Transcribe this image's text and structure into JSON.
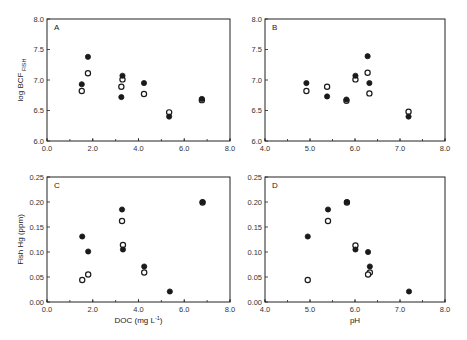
{
  "figure": {
    "header_note": "clipped running header (illegible)"
  },
  "chart_data": [
    {
      "panel": "A",
      "type": "scatter",
      "title": "",
      "xlabel": "",
      "ylabel": "log BCF",
      "ylabel_sub": "FISH",
      "xlim": [
        0.0,
        8.0
      ],
      "ylim": [
        6.0,
        8.0
      ],
      "x_ticks": [
        "0.0",
        "2.0",
        "4.0",
        "6.0",
        "8.0"
      ],
      "y_ticks": [
        "6.0",
        "6.5",
        "7.0",
        "7.5",
        "8.0"
      ],
      "x_minor_step": 1.0,
      "grid": false,
      "series": [
        {
          "name": "filled",
          "marker": "filled-circle",
          "x": [
            1.52,
            1.79,
            3.3,
            3.25,
            4.24,
            5.34,
            6.77
          ],
          "y": [
            6.93,
            7.38,
            7.07,
            6.72,
            6.95,
            6.4,
            6.69
          ]
        },
        {
          "name": "open",
          "marker": "open-circle",
          "x": [
            1.52,
            1.79,
            3.3,
            3.25,
            4.24,
            5.34,
            6.77
          ],
          "y": [
            6.82,
            7.11,
            7.01,
            6.89,
            6.77,
            6.47,
            6.67
          ]
        }
      ]
    },
    {
      "panel": "B",
      "type": "scatter",
      "title": "",
      "xlabel": "",
      "ylabel": "",
      "xlim": [
        4.0,
        8.0
      ],
      "ylim": [
        6.0,
        8.0
      ],
      "x_ticks": [
        "4.0",
        "5.0",
        "6.0",
        "7.0",
        "8.0"
      ],
      "y_ticks": [
        "6.0",
        "6.5",
        "7.0",
        "7.5",
        "8.0"
      ],
      "x_minor_step": 0.5,
      "grid": false,
      "series": [
        {
          "name": "filled",
          "marker": "filled-circle",
          "x": [
            4.92,
            5.38,
            5.81,
            6.01,
            6.28,
            6.32,
            7.19
          ],
          "y": [
            6.95,
            6.73,
            6.68,
            7.07,
            7.39,
            6.95,
            6.4
          ]
        },
        {
          "name": "open",
          "marker": "open-circle",
          "x": [
            4.92,
            5.38,
            5.81,
            6.01,
            6.28,
            6.32,
            7.19
          ],
          "y": [
            6.82,
            6.89,
            6.66,
            7.01,
            7.12,
            6.78,
            6.48
          ]
        }
      ]
    },
    {
      "panel": "C",
      "type": "scatter",
      "title": "",
      "xlabel": "DOC (mg L",
      "xlabel_sup": "-1",
      "xlabel_end": ")",
      "ylabel": "Fish Hg (ppm)",
      "xlim": [
        0.0,
        8.0
      ],
      "ylim": [
        0.0,
        0.25
      ],
      "x_ticks": [
        "0.0",
        "2.0",
        "4.0",
        "6.0",
        "8.0"
      ],
      "y_ticks": [
        "0.00",
        "0.05",
        "0.10",
        "0.15",
        "0.20",
        "0.25"
      ],
      "x_minor_step": 1.0,
      "grid": false,
      "series": [
        {
          "name": "filled",
          "marker": "filled-circle",
          "x": [
            1.54,
            1.8,
            3.28,
            3.32,
            4.25,
            5.37,
            6.8
          ],
          "y": [
            0.131,
            0.101,
            0.185,
            0.105,
            0.071,
            0.021,
            0.2
          ]
        },
        {
          "name": "open",
          "marker": "open-circle",
          "x": [
            1.54,
            1.8,
            3.28,
            3.32,
            4.25,
            6.8
          ],
          "y": [
            0.044,
            0.055,
            0.162,
            0.114,
            0.059,
            0.199
          ]
        }
      ]
    },
    {
      "panel": "D",
      "type": "scatter",
      "title": "",
      "xlabel": "pH",
      "ylabel": "",
      "xlim": [
        4.0,
        8.0
      ],
      "ylim": [
        0.0,
        0.25
      ],
      "x_ticks": [
        "4.0",
        "5.0",
        "6.0",
        "7.0",
        "8.0"
      ],
      "y_ticks": [
        "0.00",
        "0.05",
        "0.10",
        "0.15",
        "0.20",
        "0.25"
      ],
      "x_minor_step": 0.5,
      "grid": false,
      "series": [
        {
          "name": "filled",
          "marker": "filled-circle",
          "x": [
            4.95,
            5.4,
            5.82,
            6.01,
            6.29,
            6.33,
            7.2
          ],
          "y": [
            0.131,
            0.185,
            0.2,
            0.105,
            0.1,
            0.071,
            0.021
          ]
        },
        {
          "name": "open",
          "marker": "open-circle",
          "x": [
            4.95,
            5.4,
            5.82,
            6.01,
            6.33,
            6.29
          ],
          "y": [
            0.044,
            0.162,
            0.199,
            0.113,
            0.059,
            0.055
          ]
        }
      ]
    }
  ]
}
